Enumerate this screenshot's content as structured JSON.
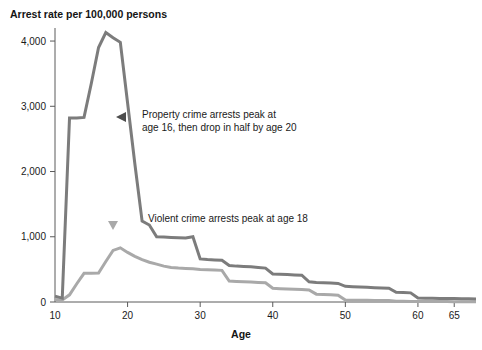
{
  "chart_data": {
    "type": "line",
    "title": "Arrest rate per 100,000 persons",
    "xlabel": "Age",
    "ylabel": "",
    "xlim": [
      10,
      68
    ],
    "ylim": [
      0,
      4200
    ],
    "grid": false,
    "legend": "none",
    "x_ticks": [
      10,
      20,
      30,
      40,
      50,
      60,
      65
    ],
    "x_tick_labels": [
      "10",
      "20",
      "30",
      "40",
      "50",
      "60",
      "65"
    ],
    "y_ticks": [
      0,
      1000,
      2000,
      3000,
      4000
    ],
    "y_tick_labels": [
      "0",
      "1,000",
      "2,000",
      "3,000",
      "4,000"
    ],
    "x": [
      10,
      11,
      12,
      13,
      14,
      15,
      16,
      17,
      18,
      19,
      20,
      21,
      22,
      23,
      24,
      25,
      26,
      27,
      28,
      29,
      30,
      31,
      32,
      33,
      34,
      35,
      36,
      37,
      38,
      39,
      40,
      41,
      42,
      43,
      44,
      45,
      46,
      47,
      48,
      49,
      50,
      51,
      52,
      53,
      54,
      55,
      56,
      57,
      58,
      59,
      60,
      61,
      62,
      63,
      64,
      65,
      66,
      67,
      68
    ],
    "series": [
      {
        "name": "Property crime arrests",
        "color": "#7c7c7c",
        "width": 3,
        "values": [
          90,
          60,
          2820,
          2820,
          2830,
          3350,
          3900,
          4130,
          4050,
          3980,
          3050,
          2120,
          1240,
          1180,
          1000,
          995,
          990,
          985,
          980,
          1000,
          660,
          650,
          645,
          640,
          560,
          550,
          545,
          540,
          530,
          520,
          430,
          425,
          420,
          415,
          410,
          310,
          300,
          295,
          290,
          285,
          240,
          235,
          230,
          225,
          220,
          215,
          210,
          150,
          145,
          140,
          60,
          58,
          56,
          55,
          54,
          52,
          50,
          48,
          46
        ]
      },
      {
        "name": "Violent crime arrests",
        "color": "#a9a9a9",
        "width": 3,
        "values": [
          40,
          30,
          110,
          280,
          440,
          440,
          445,
          620,
          790,
          830,
          760,
          700,
          650,
          610,
          580,
          550,
          530,
          520,
          515,
          510,
          500,
          495,
          490,
          485,
          320,
          315,
          310,
          305,
          300,
          295,
          210,
          205,
          200,
          195,
          190,
          185,
          120,
          115,
          110,
          105,
          30,
          28,
          26,
          25,
          24,
          23,
          22,
          12,
          10,
          9,
          8,
          7,
          7,
          6,
          6,
          5,
          5,
          5,
          4
        ]
      }
    ],
    "annotations": [
      {
        "id": "property-annotation",
        "lines": [
          "Property crime arrests peak at",
          "age 16, then drop in half by age 20"
        ],
        "text_x": 142,
        "text_y": 118,
        "marker": "left-triangle",
        "marker_x": 125,
        "marker_y": 117,
        "marker_color": "#4d4d4d"
      },
      {
        "id": "violent-annotation",
        "lines": [
          "Violent crime arrests peak at age 18"
        ],
        "text_x": 148,
        "text_y": 222,
        "marker": "down-triangle",
        "marker_x": 113,
        "marker_y": 229,
        "marker_color": "#a9a9a9"
      }
    ]
  }
}
